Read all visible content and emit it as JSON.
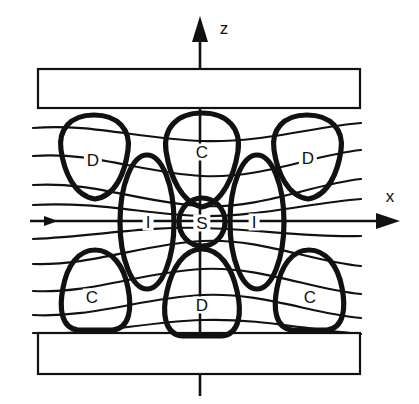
{
  "figure": {
    "background_color": "#ffffff",
    "line_color": "#111111",
    "width": 419,
    "height": 404
  },
  "axes": {
    "vertical": {
      "name": "z-axis",
      "label": "z",
      "label_x": 224,
      "label_y": 28,
      "x": 200,
      "top_y": 18,
      "bottom_y": 396,
      "arrow_at": "top"
    },
    "horizontal": {
      "name": "x-axis",
      "label": "x",
      "label_x": 390,
      "label_y": 196,
      "y": 221,
      "left_x": 30,
      "right_x": 398,
      "arrow_at": "right"
    }
  },
  "plates": [
    {
      "name": "upper-plate",
      "x": 38,
      "y": 69,
      "width": 322,
      "height": 39
    },
    {
      "name": "lower-plate",
      "x": 38,
      "y": 333,
      "width": 322,
      "height": 41
    }
  ],
  "regions": [
    {
      "id": "D-upper-left",
      "label": "D",
      "x": 93,
      "y": 160
    },
    {
      "id": "C-upper-mid",
      "label": "C",
      "x": 202,
      "y": 152
    },
    {
      "id": "D-upper-right",
      "label": "D",
      "x": 308,
      "y": 158
    },
    {
      "id": "I-left",
      "label": "I",
      "x": 148,
      "y": 222
    },
    {
      "id": "S-center",
      "label": "S",
      "x": 202,
      "y": 223
    },
    {
      "id": "I-right",
      "label": "I",
      "x": 254,
      "y": 222
    },
    {
      "id": "C-lower-left",
      "label": "C",
      "x": 92,
      "y": 297
    },
    {
      "id": "D-lower-mid",
      "label": "D",
      "x": 202,
      "y": 305
    },
    {
      "id": "C-lower-right",
      "label": "C",
      "x": 310,
      "y": 297
    }
  ],
  "field_lines": {
    "count": 9,
    "left_x": 33,
    "right_x": 361,
    "description": "wavy horizontal magnetic field lines sagging toward the centre above the x-axis and bowing up below it",
    "y_left": [
      128,
      155,
      184,
      221,
      258,
      287,
      312,
      332,
      205
    ],
    "curvature": [
      14,
      18,
      20,
      0,
      -20,
      -18,
      -14,
      -8,
      8
    ]
  },
  "blob_shapes": {
    "d_upper_left": {
      "cx": 94,
      "cy": 158,
      "rx": 36,
      "ry": 44
    },
    "c_upper_mid": {
      "cx": 202,
      "cy": 158,
      "rx": 36,
      "ry": 48
    },
    "d_upper_right": {
      "cx": 307,
      "cy": 158,
      "rx": 36,
      "ry": 44
    },
    "s_center": {
      "cx": 202,
      "cy": 222,
      "rx": 23,
      "ry": 24
    },
    "i_left_oval": {
      "cx": 147,
      "cy": 222,
      "rx": 27,
      "ry": 67
    },
    "i_right_oval": {
      "cx": 257,
      "cy": 222,
      "rx": 27,
      "ry": 67
    },
    "c_lower_left": {
      "cx": 95,
      "cy": 292,
      "rx": 37,
      "ry": 42
    },
    "d_lower_mid": {
      "cx": 202,
      "cy": 292,
      "rx": 37,
      "ry": 46
    },
    "c_lower_right": {
      "cx": 309,
      "cy": 292,
      "rx": 37,
      "ry": 42
    }
  }
}
